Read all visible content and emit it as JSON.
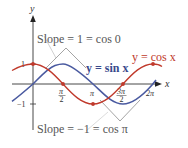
{
  "figure": {
    "axes": {
      "x_label": "x",
      "y_label": "y",
      "y_ticks": [
        "1",
        "−1"
      ],
      "x_ticks": [
        {
          "num": "π",
          "den": "2",
          "x": 62
        },
        {
          "num": "π",
          "den": "",
          "x": 93
        },
        {
          "num": "3π",
          "den": "2",
          "x": 122
        },
        {
          "num": "2π",
          "den": "",
          "x": 152
        }
      ]
    },
    "curves": [
      {
        "name": "sin",
        "label": "y = sin x",
        "color": "#4a5aa0"
      },
      {
        "name": "cos",
        "label": "y = cos x",
        "color": "#c0392b"
      }
    ],
    "annotations": {
      "top": "Slope = 1 = cos 0",
      "bottom": "Slope = −1 = cos π"
    },
    "colors": {
      "sin": "#4a5aa0",
      "cos": "#c0392b",
      "axis": "#333333",
      "tangent": "#9a9a9a"
    }
  }
}
